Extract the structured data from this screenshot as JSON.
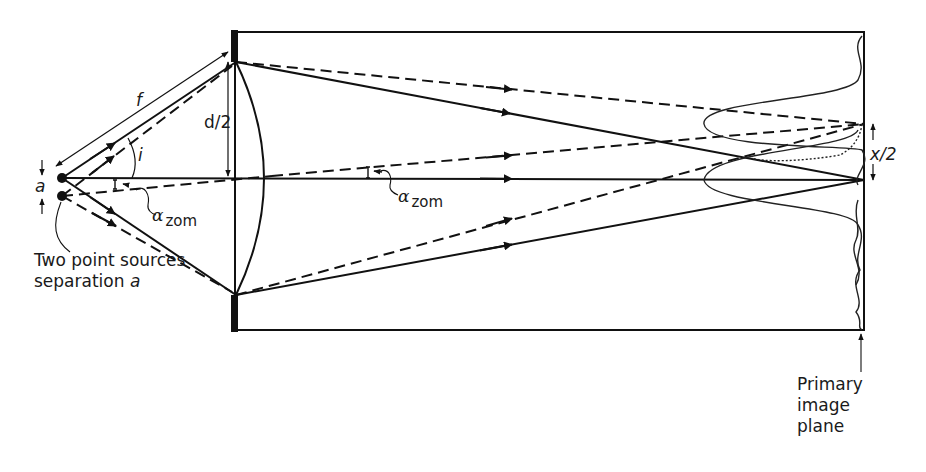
{
  "diagram": {
    "colors": {
      "line": "#111111",
      "background": "#ffffff"
    },
    "labels": {
      "focal_length": "f",
      "half_aperture": "d/2",
      "half_angle": "i",
      "source_separation": "a",
      "angle_symbol": "α",
      "angle_subscript": "zom",
      "image_half_separation": "x/2",
      "sources_caption_line1": "Two point sources",
      "sources_caption_line2_prefix": "separation ",
      "sources_caption_line2_var": "a",
      "image_plane_line1": "Primary",
      "image_plane_line2": "image",
      "image_plane_line3": "plane"
    },
    "elements": {
      "point_sources": 2,
      "ray_styles": [
        "solid (source 1)",
        "dashed (source 2)"
      ],
      "airy_patterns": 2
    }
  }
}
